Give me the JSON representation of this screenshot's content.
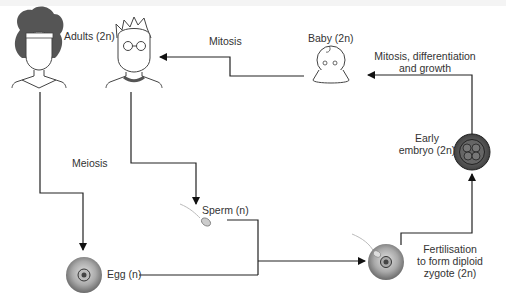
{
  "diagram": {
    "type": "human life cycle",
    "labels": {
      "adults": "Adults (2n)",
      "mitosis": "Mitosis",
      "baby": "Baby (2n)",
      "mitosis_growth_line1": "Mitosis, differentiation",
      "mitosis_growth_line2": "and growth",
      "early_embryo_line1": "Early",
      "early_embryo_line2": "embryo (2n)",
      "meiosis": "Meiosis",
      "sperm": "Sperm (n)",
      "egg": "Egg (n)",
      "fertilisation_line1": "Fertilisation",
      "fertilisation_line2": "to form diploid",
      "fertilisation_line3": "zygote (2n)"
    },
    "nodes": [
      "Adults (woman)",
      "Adults (man)",
      "Egg",
      "Sperm",
      "Zygote",
      "Early embryo",
      "Baby"
    ],
    "edges": [
      {
        "from": "Adults (woman)",
        "to": "Egg",
        "label": "Meiosis"
      },
      {
        "from": "Adults (man)",
        "to": "Sperm",
        "label": "Meiosis"
      },
      {
        "from": "Egg",
        "to": "Zygote",
        "label": ""
      },
      {
        "from": "Sperm",
        "to": "Zygote",
        "label": ""
      },
      {
        "from": "Zygote",
        "to": "Early embryo",
        "label": "Fertilisation to form diploid zygote (2n)"
      },
      {
        "from": "Early embryo",
        "to": "Baby",
        "label": "Mitosis, differentiation and growth"
      },
      {
        "from": "Baby",
        "to": "Adults (man)",
        "label": "Mitosis"
      }
    ],
    "colors": {
      "line": "#222222",
      "cell_dark": "#555555",
      "cell_light": "#bbbbbb",
      "text": "#333333"
    }
  }
}
